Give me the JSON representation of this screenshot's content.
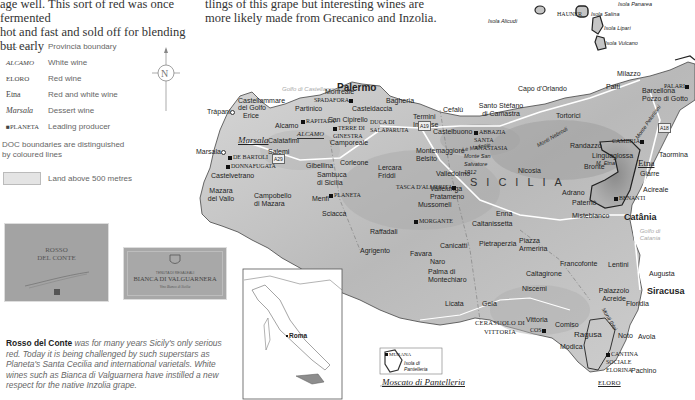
{
  "intro_text": {
    "col1_line1": "age well. This sort of  red was once fermented",
    "col1_line2": "hot and fast and sold off for blending but early",
    "col2_line1": "tlings of this grape but interesting wines are",
    "col2_line2": "more likely made from Grecanico and Inzolia."
  },
  "legend": {
    "items": [
      {
        "symbol": "— - - —",
        "label": "Provincia boundary"
      },
      {
        "symbol": "ALCAMO",
        "label": "White wine"
      },
      {
        "symbol": "ELORO",
        "label": "Red wine"
      },
      {
        "symbol": "Etna",
        "label": "Red and white wine"
      },
      {
        "symbol": "Marsala",
        "label": "Dessert wine"
      },
      {
        "symbol": "■PLANETA",
        "label": "Leading producer"
      }
    ],
    "doc_note": "DOC boundaries are distinguished by coloured lines",
    "land_label": "Land above 500 metres"
  },
  "compass": {
    "label": "N"
  },
  "labels_images": {
    "rosso": {
      "line1": "ROSSO",
      "line2": "DEL CONTE"
    },
    "bianca": {
      "top": "TENUTA DI REGALEALI",
      "name": "BIANCA DI VALGUARNERA",
      "sub": "Vino Bianco di Sicilia"
    }
  },
  "caption": {
    "bold": "Rosso del Conte",
    "text": " was for many years Sicily's only serious red. Today it is being challenged by such superstars as Planeta's Santa Cecilia and international varietals. White wines such as Bianca di Valguarnera have instilled a new respect for the native Inzolia grape."
  },
  "inset_italy": {
    "city": "Roma"
  },
  "inset_pantelleria": {
    "producer": "MURANA",
    "island": "Isola di Pantelleria",
    "title": "Moscato di Pantelleria"
  },
  "map": {
    "region": "SICILIA",
    "islands": [
      "Isola Alicudi",
      "Isola Salina",
      "Isola Lipari",
      "Isola Vulcano",
      "Isola Panarea",
      "Isola Filicudi"
    ],
    "seas": [
      "Golfo di Castellammare",
      "Golfo di Catania"
    ],
    "major_cities": [
      "Palermo",
      "Catânia",
      "Siracusa"
    ],
    "towns": [
      "Trápani",
      "Erice",
      "Castellammare del Golfo",
      "Partinico",
      "Alcamo",
      "Marsala",
      "Calatafimi",
      "Salemi",
      "Mazara del Vallo",
      "Castelvetrano",
      "Campobello di Mazara",
      "Menfi",
      "Sciacca",
      "Sambuca di Sicilia",
      "Gibellina",
      "Corleone",
      "Camporeale",
      "San Cipirello",
      "Monreale",
      "Bagheria",
      "Casteldaccia",
      "Termini Imerese",
      "Cefalù",
      "Santo Stéfano di Camastra",
      "Castelbuono",
      "Capo d'Orlando",
      "Patti",
      "Milazzo",
      "Barcellona Pozzo di Gotto",
      "Tortorici",
      "Randazzo",
      "Linguaglossa",
      "Bronte",
      "Adrano",
      "Paternò",
      "Giarre",
      "Acireale",
      "Taormina",
      "Mistebianco",
      "Lentini",
      "Augusta",
      "Francofonte",
      "Caltagirone",
      "Niscemi",
      "Palazzolo Acreide",
      "Floridia",
      "Avola",
      "Noto",
      "Pachino",
      "Ragusa",
      "Modica",
      "Comiso",
      "Vittoria",
      "Gela",
      "Licata",
      "Palma di Montechiaro",
      "Naro",
      "Favara",
      "Agrigento",
      "Raffadali",
      "Canicattì",
      "Caltanissetta",
      "Mussomeli",
      "Vallelunga Pratameno",
      "Valledolmo",
      "Lercara Friddi",
      "Montemaggiore Belsito",
      "Enna",
      "Pietraperzia",
      "Piazza Armerina",
      "Nicosia"
    ],
    "mountains": [
      "Le Madonie",
      "Monte San Salvatore 1912",
      "Monti Nebrodi",
      "Monte Peloritani",
      "M. Etna",
      "Monti Iblei"
    ],
    "doc_zones": [
      "ALCAMO",
      "Marsala",
      "Etna",
      "ELORO",
      "CERASUOLO DI VITTORIA",
      "FARO"
    ],
    "producers": [
      "SPADAFORA",
      "RAPITALÀ",
      "TERRE DI GINESTRA",
      "DUCA DI SALAPARUTA",
      "DE BARTOLI",
      "DONNAFUGATA",
      "PLANETA",
      "TASCA D'ALMERITA",
      "MORGANTE",
      "ABBAZIA SANTA ANASTASIA",
      "CAMBRIA",
      "PALARI",
      "BENANTI",
      "COS",
      "CANTINA SOCIALE ELORINA",
      "HAUNER"
    ],
    "roads": [
      "A19",
      "A29",
      "A18",
      "A20"
    ]
  }
}
